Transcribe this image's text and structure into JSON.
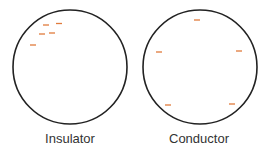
{
  "colors": {
    "outline": "#222222",
    "charge": "#e07b3c",
    "label": "#333333"
  },
  "diagrams": [
    {
      "label": "Insulator",
      "circle": {
        "cx": 70,
        "cy": 67,
        "r": 57
      },
      "charges": [
        {
          "type": "negative",
          "x": 46,
          "y": 25
        },
        {
          "type": "negative",
          "x": 59,
          "y": 23.5
        },
        {
          "type": "negative",
          "x": 42,
          "y": 34
        },
        {
          "type": "negative",
          "x": 52,
          "y": 33
        },
        {
          "type": "negative",
          "x": 33,
          "y": 45
        }
      ]
    },
    {
      "label": "Conductor",
      "circle": {
        "cx": 200,
        "cy": 67,
        "r": 57
      },
      "charges": [
        {
          "type": "negative",
          "x": 197,
          "y": 20
        },
        {
          "type": "negative",
          "x": 159,
          "y": 52
        },
        {
          "type": "negative",
          "x": 239,
          "y": 51
        },
        {
          "type": "negative",
          "x": 168,
          "y": 105
        },
        {
          "type": "negative",
          "x": 232,
          "y": 104
        }
      ]
    }
  ]
}
